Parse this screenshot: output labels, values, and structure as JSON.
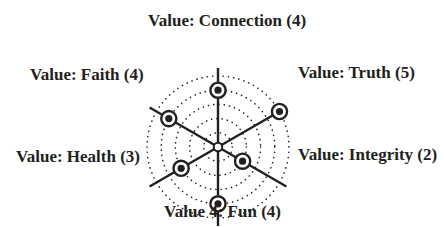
{
  "diagram": {
    "type": "radar-values-wheel",
    "scale_max": 5,
    "rings": 5,
    "colors": {
      "ink": "#231f20",
      "background": "#ffffff",
      "marker_fill": "#ffffff"
    },
    "axes": [
      {
        "id": "connection",
        "label": "Value: Connection (4)",
        "value": 4,
        "angle_deg": 90
      },
      {
        "id": "truth",
        "label": "Value: Truth (5)",
        "value": 5,
        "angle_deg": 30
      },
      {
        "id": "integrity",
        "label": "Value: Integrity (2)",
        "value": 2,
        "angle_deg": -30
      },
      {
        "id": "fun",
        "label": "Value 4: Fun (4)",
        "value": 4,
        "angle_deg": -90
      },
      {
        "id": "health",
        "label": "Value: Health (3)",
        "value": 3,
        "angle_deg": -150
      },
      {
        "id": "faith",
        "label": "Value: Faith (4)",
        "value": 4,
        "angle_deg": 150
      }
    ]
  }
}
